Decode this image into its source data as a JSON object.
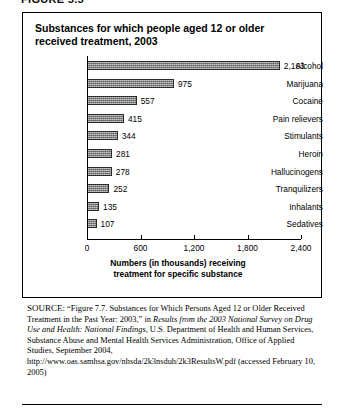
{
  "figure_label": "FIGURE 5.5",
  "panel": {
    "title": "Substances for which people aged 12 or older received treatment, 2003"
  },
  "chart_data": {
    "type": "bar",
    "orientation": "horizontal",
    "title": "Substances for which people aged 12 or older received treatment, 2003",
    "categories": [
      "Alcohol",
      "Marijuana",
      "Cocaine",
      "Pain relievers",
      "Stimulants",
      "Heroin",
      "Hallucinogens",
      "Tranquilizers",
      "Inhalants",
      "Sedatives"
    ],
    "values": [
      2163,
      975,
      557,
      415,
      344,
      281,
      278,
      252,
      135,
      107
    ],
    "value_labels": [
      "2,163",
      "975",
      "557",
      "415",
      "344",
      "281",
      "278",
      "252",
      "135",
      "107"
    ],
    "xlabel": "Numbers (in thousands) receiving treatment for specific substance",
    "ylabel": "",
    "xlim": [
      0,
      2400
    ],
    "xticks": [
      0,
      600,
      1200,
      1800,
      2400
    ],
    "xtick_labels": [
      "0",
      "600",
      "1,200",
      "1,800",
      "2,400"
    ],
    "grid": false,
    "legend": "none",
    "bar_color": "#8d8d8d",
    "bar_border_color": "#2a2a2a"
  },
  "axis": {
    "title_line1": "Numbers (in thousands) receiving",
    "title_line2": "treatment for specific substance"
  },
  "source": {
    "label": "SOURCE:",
    "text_part1": "“Figure 7.7. Substances for Which Persons Aged 12 or Older Received Treatment in the Past Year: 2003,” in ",
    "italic_title": "Results from the 2003 National Survey on Drug Use and Health: National Findings",
    "text_part2": ", U.S. Department of Health and Human Services, Substance Abuse and Mental Health Services Administration, Office of Applied Studies, September 2004, http://www.oas.samhsa.gov/nhsda/2k3nsduh/2k3ResultsW.pdf (accessed February 10, 2005)"
  }
}
